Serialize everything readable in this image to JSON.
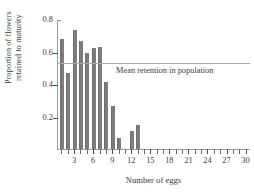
{
  "chart_data": {
    "type": "bar",
    "title": "",
    "xlabel": "Number of eggs",
    "ylabel": "Proportion of flowers\nretained to maturity",
    "categories": [
      1,
      2,
      3,
      4,
      5,
      6,
      7,
      8,
      9,
      10,
      11,
      12,
      13,
      14,
      15,
      16,
      17,
      18,
      19,
      20,
      21,
      22,
      23,
      24,
      25,
      26,
      27,
      28,
      29,
      30
    ],
    "values": [
      0.68,
      0.47,
      0.735,
      0.665,
      0.59,
      0.62,
      0.63,
      0.415,
      0.265,
      0.065,
      0.0,
      0.11,
      0.15,
      0,
      0,
      0,
      0,
      0,
      0,
      0,
      0,
      0,
      0,
      0,
      0,
      0,
      0,
      0,
      0,
      0
    ],
    "ylim": [
      0,
      0.8
    ],
    "xlim": [
      0.3,
      30.7
    ],
    "ytick_labels": [
      "0.2",
      "0.4",
      "0.6",
      "0.8"
    ],
    "ytick_values": [
      0.2,
      0.4,
      0.6,
      0.8
    ],
    "xtick_labels": [
      "3",
      "6",
      "9",
      "12",
      "15",
      "18",
      "21",
      "24",
      "27",
      "30"
    ],
    "xtick_values": [
      3,
      6,
      9,
      12,
      15,
      18,
      21,
      24,
      27,
      30
    ],
    "grid": false,
    "legend": "none",
    "bar_color": "#7d7d7d",
    "annotations": [
      {
        "name": "mean-retention-line",
        "label": "Mean retention in population",
        "type": "hline",
        "y": 0.535,
        "color": "#a9a9a9"
      }
    ]
  }
}
